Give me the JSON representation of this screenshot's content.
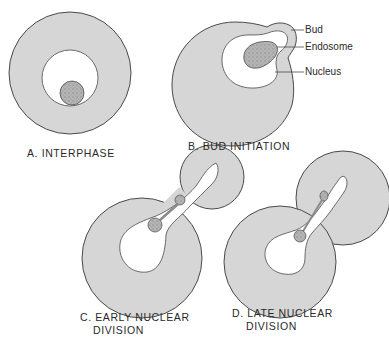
{
  "figure": {
    "panels": [
      {
        "id": "A",
        "caption_line1": "A. INTERPHASE",
        "caption_line2": ""
      },
      {
        "id": "B",
        "caption_line1": "B. BUD INITIATION",
        "caption_line2": ""
      },
      {
        "id": "C",
        "caption_line1": "C. EARLY NUCLEAR",
        "caption_line2": "DIVISION"
      },
      {
        "id": "D",
        "caption_line1": "D. LATE NUCLEAR",
        "caption_line2": "DIVISION"
      }
    ],
    "callouts": {
      "bud": "Bud",
      "endosome": "Endosome",
      "nucleus": "Nucleus"
    },
    "colors": {
      "cytoplasm": "#d6d6d6",
      "outline": "#4a4a4a",
      "nucleus": "#ffffff",
      "endosome": "#a9a9a9"
    }
  }
}
